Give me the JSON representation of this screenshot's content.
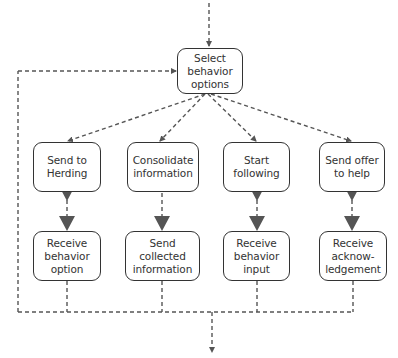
{
  "diagram": {
    "type": "flowchart",
    "colors": {
      "line": "#555555",
      "node_border": "#333333",
      "text": "#333333",
      "arrowhead": "#555555"
    },
    "top_node": {
      "label": "Select\nbehavior\noptions"
    },
    "branches": [
      {
        "action": "Send to\nHerding",
        "response": "Receive\nbehavior\noption"
      },
      {
        "action": "Consolidate\ninformation",
        "response": "Send\ncollected\ninformation"
      },
      {
        "action": "Start\nfollowing",
        "response": "Receive\nbehavior\ninput"
      },
      {
        "action": "Send offer\nto help",
        "response": "Receive\nacknow-\nledgement"
      }
    ],
    "edges": [
      "entry -> Select behavior options",
      "Select behavior options -> Send to Herding",
      "Select behavior options -> Consolidate information",
      "Select behavior options -> Start following",
      "Select behavior options -> Send offer to help",
      "Send to Herding -> Receive behavior option",
      "Consolidate information -> Send collected information",
      "Start following -> Receive behavior input",
      "Send offer to help -> Receive acknowledgement",
      "all responses -> merge line",
      "merge line -> loop back to Select behavior options",
      "merge line -> exit"
    ]
  }
}
